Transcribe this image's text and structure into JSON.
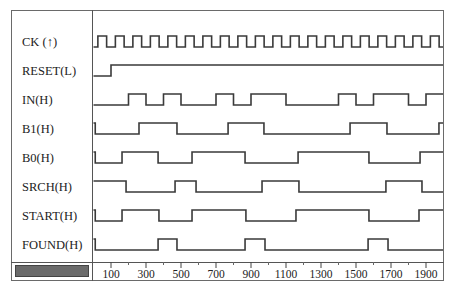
{
  "diagram": {
    "type": "timing",
    "time_axis": {
      "ticks": [
        100,
        300,
        500,
        700,
        900,
        1100,
        1300,
        1500,
        1700,
        1900
      ],
      "tick_labels": [
        "100",
        "300",
        "500",
        "700",
        "900",
        "1100",
        "1300",
        "1500",
        "1700",
        "1900"
      ],
      "minor_ticks": [
        200,
        400,
        600,
        800,
        1000,
        1200,
        1400,
        1600,
        1800
      ],
      "range": [
        0,
        2000
      ]
    },
    "signals": [
      {
        "label": "CK (↑)",
        "name": "ck",
        "initial": 0,
        "clock": {
          "first_rise": 25,
          "period": 100,
          "end": 2000
        }
      },
      {
        "label": "RESET(L)",
        "name": "reset",
        "initial": 0,
        "edges": [
          100
        ]
      },
      {
        "label": "IN(H)",
        "name": "in",
        "initial": 0,
        "edges": [
          200,
          300,
          400,
          500,
          700,
          800,
          900,
          1100,
          1400,
          1500,
          1600,
          1800,
          1900
        ]
      },
      {
        "label": "B1(H)",
        "name": "b1",
        "initial": 1,
        "edges": [
          10,
          260,
          477,
          769,
          974,
          1466,
          1677,
          1974
        ]
      },
      {
        "label": "B0(H)",
        "name": "b0",
        "initial": 1,
        "edges": [
          10,
          163,
          369,
          563,
          866,
          1169,
          1574,
          1866
        ]
      },
      {
        "label": "SRCH(H)",
        "name": "srch",
        "initial": 1,
        "edges": [
          186,
          466,
          586,
          963,
          1174,
          1671,
          1877
        ]
      },
      {
        "label": "START(H)",
        "name": "start",
        "initial": 1,
        "edges": [
          10,
          163,
          374,
          563,
          871,
          1157,
          1574,
          1860
        ]
      },
      {
        "label": "FOUND(H)",
        "name": "found",
        "initial": 1,
        "edges": [
          10,
          369,
          477,
          866,
          980,
          1569,
          1683
        ]
      }
    ]
  },
  "colors": {
    "wave": "#3a3a3a",
    "border": "#555555",
    "scrollbar": "#6b6b6b"
  }
}
